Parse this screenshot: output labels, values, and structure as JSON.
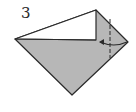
{
  "step": {
    "number": "3"
  },
  "diagram": {
    "type": "origami-step",
    "colors": {
      "paper_colored": "#b7b7b7",
      "paper_white": "#ffffff",
      "line": "#2a2a2a"
    },
    "elements": [
      "folded-paper-shape",
      "white-flap",
      "fold-line",
      "fold-arrow"
    ]
  }
}
